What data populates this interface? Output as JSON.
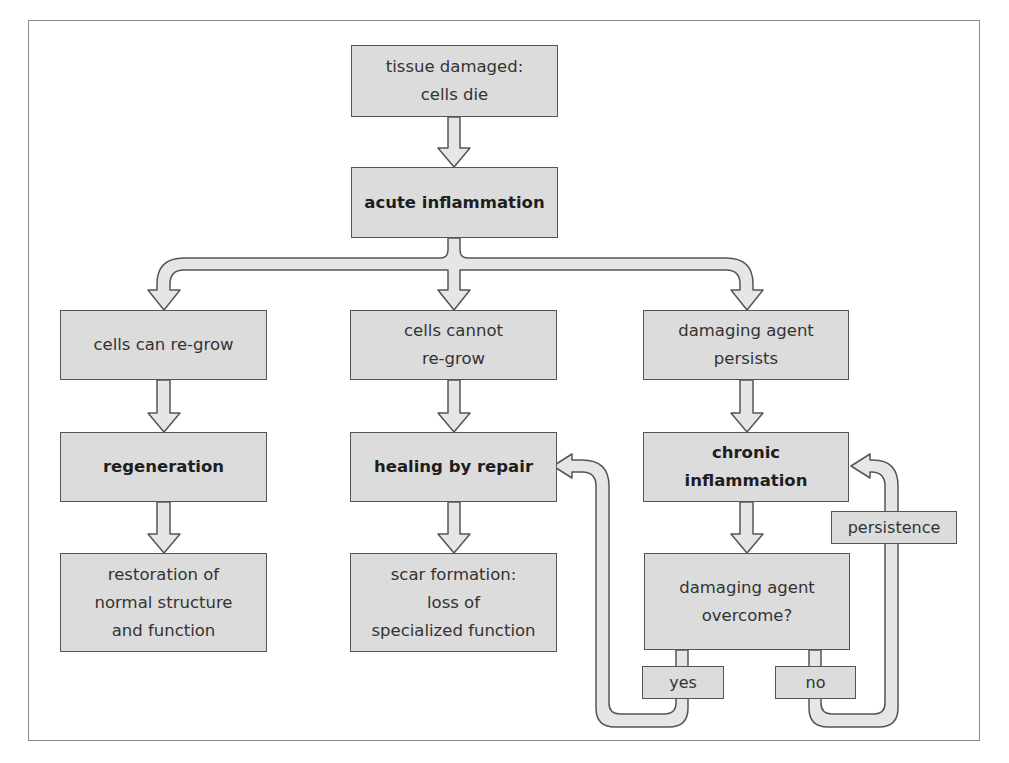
{
  "diagram": {
    "colors": {
      "box_fill": "#dcdcdc",
      "box_border": "#555555",
      "arrow_fill": "#e6e6e6",
      "frame": "#8a8a8a"
    },
    "nodes": {
      "tissue_damaged": "tissue damaged:\ncells die",
      "acute_inflammation": "acute inflammation",
      "cells_can_regrow": "cells can re-grow",
      "cells_cannot_regrow": "cells cannot\nre-grow",
      "agent_persists": "damaging agent\npersists",
      "regeneration": "regeneration",
      "healing_by_repair": "healing by repair",
      "chronic_inflammation": "chronic\ninflammation",
      "restoration": "restoration of\nnormal structure\nand function",
      "scar_formation": "scar formation:\nloss of\nspecialized function",
      "agent_overcome": "damaging agent\novercome?",
      "yes": "yes",
      "no": "no",
      "persistence": "persistence"
    },
    "edges": [
      [
        "tissue_damaged",
        "acute_inflammation"
      ],
      [
        "acute_inflammation",
        "cells_can_regrow"
      ],
      [
        "acute_inflammation",
        "cells_cannot_regrow"
      ],
      [
        "acute_inflammation",
        "agent_persists"
      ],
      [
        "cells_can_regrow",
        "regeneration"
      ],
      [
        "regeneration",
        "restoration"
      ],
      [
        "cells_cannot_regrow",
        "healing_by_repair"
      ],
      [
        "healing_by_repair",
        "scar_formation"
      ],
      [
        "agent_persists",
        "chronic_inflammation"
      ],
      [
        "chronic_inflammation",
        "agent_overcome"
      ],
      [
        "agent_overcome",
        "yes"
      ],
      [
        "yes",
        "healing_by_repair"
      ],
      [
        "agent_overcome",
        "no"
      ],
      [
        "no",
        "persistence"
      ],
      [
        "persistence",
        "chronic_inflammation"
      ]
    ]
  }
}
